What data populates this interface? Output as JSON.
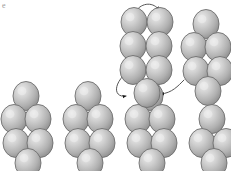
{
  "figure": {
    "corner_mark": "e",
    "type": "bead-chain-conformation-diagram",
    "background_color": "#ffffff",
    "bead": {
      "fill_light": "#e3e3e3",
      "fill_mid": "#b4b4b4",
      "fill_dark": "#8d8d8d",
      "stroke_color": "#6e6e6e",
      "rx": 13,
      "ry": 14.5,
      "highlight_offset_x": -4,
      "highlight_offset_y": -5
    },
    "connector": {
      "stroke_color": "#555555",
      "stroke_width": 1,
      "arrow_color": "#1a1a1a",
      "arrow_size": 3.4
    }
  },
  "chart_data": {
    "type": "scatter",
    "title": "",
    "xlabel": "",
    "ylabel": "",
    "xlim": [
      0,
      231
    ],
    "ylim": [
      171,
      0
    ],
    "grid": false,
    "legend": null,
    "series": [
      {
        "name": "beads-unit-1-ground",
        "kind": "bead-cluster",
        "points": [
          {
            "x": 26,
            "y": 96
          },
          {
            "x": 14,
            "y": 119
          },
          {
            "x": 38,
            "y": 119
          },
          {
            "x": 16,
            "y": 143
          },
          {
            "x": 40,
            "y": 143
          },
          {
            "x": 28,
            "y": 163
          }
        ]
      },
      {
        "name": "beads-unit-2-ground",
        "kind": "bead-cluster",
        "points": [
          {
            "x": 88,
            "y": 96
          },
          {
            "x": 76,
            "y": 119
          },
          {
            "x": 100,
            "y": 119
          },
          {
            "x": 78,
            "y": 143
          },
          {
            "x": 102,
            "y": 143
          },
          {
            "x": 90,
            "y": 163
          }
        ]
      },
      {
        "name": "beads-unit-3-ground",
        "kind": "bead-cluster",
        "points": [
          {
            "x": 150,
            "y": 96
          },
          {
            "x": 138,
            "y": 119
          },
          {
            "x": 162,
            "y": 119
          },
          {
            "x": 140,
            "y": 143
          },
          {
            "x": 164,
            "y": 143
          },
          {
            "x": 152,
            "y": 163
          }
        ]
      },
      {
        "name": "beads-unit-4-raised",
        "kind": "bead-cluster",
        "points": [
          {
            "x": 206,
            "y": 24
          },
          {
            "x": 194,
            "y": 47
          },
          {
            "x": 218,
            "y": 47
          },
          {
            "x": 196,
            "y": 71
          },
          {
            "x": 220,
            "y": 71
          },
          {
            "x": 208,
            "y": 91
          }
        ]
      },
      {
        "name": "beads-unit-5-ground-right",
        "kind": "bead-cluster",
        "points": [
          {
            "x": 212,
            "y": 119
          },
          {
            "x": 202,
            "y": 143
          },
          {
            "x": 226,
            "y": 143
          },
          {
            "x": 214,
            "y": 163
          }
        ]
      },
      {
        "name": "beads-lifted-loop",
        "kind": "bead-cluster",
        "points": [
          {
            "x": 134,
            "y": 22
          },
          {
            "x": 160,
            "y": 22
          },
          {
            "x": 133,
            "y": 46
          },
          {
            "x": 159,
            "y": 46
          },
          {
            "x": 133,
            "y": 70
          },
          {
            "x": 159,
            "y": 70
          }
        ]
      },
      {
        "name": "bead-bridge-lower",
        "kind": "bead-cluster",
        "points": [
          {
            "x": 147,
            "y": 93
          }
        ]
      }
    ],
    "connectors": [
      {
        "name": "loop-top-arrow",
        "path": "M 136 11 C 142 2 154 2 159 10",
        "arrow_at": "end",
        "arrow_angle": 52
      },
      {
        "name": "loop-bottom-left",
        "path": "M 123 76 C 112 88 116 98 126 96",
        "arrow_at": "end",
        "arrow_angle": 350
      },
      {
        "name": "loop-bottom-right",
        "path": "M 159 82 C 160 90 152 94 148 93",
        "arrow_at": "none",
        "arrow_angle": 0
      },
      {
        "name": "bridge-to-right",
        "path": "M 161 94 C 172 93 178 86 184 80",
        "arrow_at": "start",
        "arrow_angle": 200
      }
    ],
    "annotations": [
      {
        "text": "e",
        "x": 5,
        "y": 7
      }
    ]
  }
}
